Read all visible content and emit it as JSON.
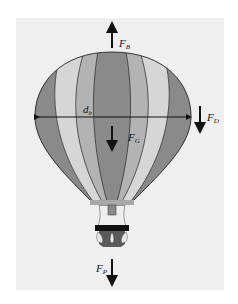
{
  "figure": {
    "labels": {
      "buoyancy": {
        "main": "F",
        "sub": "B"
      },
      "drag": {
        "main": "F",
        "sub": "D"
      },
      "gravity": {
        "main": "F",
        "sub": "G"
      },
      "payload": {
        "main": "F",
        "sub": "P"
      },
      "diameter": {
        "main": "d",
        "sub": "b"
      }
    },
    "colors": {
      "background": "#efefef",
      "stripe_dark": "#8a8a8a",
      "stripe_mid": "#b3b3b3",
      "stripe_light": "#d6d6d6",
      "basket": "#5a5a5a",
      "basket_rim": "#111111",
      "arrow": "#111111"
    }
  }
}
